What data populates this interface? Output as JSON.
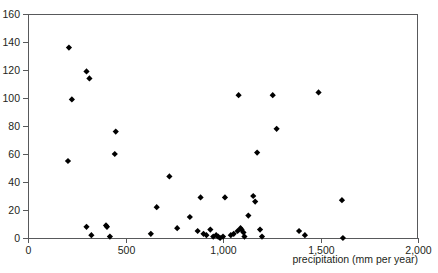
{
  "chart_data": {
    "type": "scatter",
    "title": "",
    "subtitle": "",
    "xlabel": "precipitation (mm per year)",
    "ylabel": "",
    "xlim": [
      0,
      2000
    ],
    "ylim": [
      0,
      160
    ],
    "xticks": [
      0,
      500,
      1000,
      1500,
      2000
    ],
    "xticklabels": [
      "0",
      "500",
      "1,000",
      "1,500",
      "2,000"
    ],
    "yticks": [
      0,
      20,
      40,
      60,
      80,
      100,
      120,
      140,
      160
    ],
    "yticklabels": [
      "0",
      "20",
      "40",
      "60",
      "80",
      "100",
      "120",
      "140",
      "160"
    ],
    "grid": false,
    "legend": null,
    "marker": {
      "shape": "diamond",
      "color": "#000000",
      "size": 5
    },
    "series": [
      {
        "name": "observations",
        "points": [
          [
            210,
            136
          ],
          [
            225,
            99
          ],
          [
            300,
            119
          ],
          [
            315,
            114
          ],
          [
            450,
            76
          ],
          [
            205,
            55
          ],
          [
            445,
            60
          ],
          [
            300,
            8
          ],
          [
            325,
            2
          ],
          [
            400,
            9
          ],
          [
            405,
            8
          ],
          [
            420,
            1
          ],
          [
            630,
            3
          ],
          [
            660,
            22
          ],
          [
            725,
            44
          ],
          [
            765,
            7
          ],
          [
            830,
            15
          ],
          [
            870,
            5
          ],
          [
            885,
            29
          ],
          [
            900,
            3
          ],
          [
            915,
            2
          ],
          [
            935,
            6
          ],
          [
            950,
            1
          ],
          [
            965,
            2
          ],
          [
            975,
            1
          ],
          [
            985,
            0
          ],
          [
            1000,
            1
          ],
          [
            1010,
            29
          ],
          [
            1040,
            2
          ],
          [
            1055,
            3
          ],
          [
            1075,
            5
          ],
          [
            1080,
            102
          ],
          [
            1090,
            7
          ],
          [
            1095,
            6
          ],
          [
            1105,
            4
          ],
          [
            1110,
            1
          ],
          [
            1130,
            16
          ],
          [
            1155,
            30
          ],
          [
            1165,
            26
          ],
          [
            1175,
            61
          ],
          [
            1190,
            6
          ],
          [
            1200,
            1
          ],
          [
            1255,
            102
          ],
          [
            1275,
            78
          ],
          [
            1390,
            5
          ],
          [
            1420,
            2
          ],
          [
            1490,
            104
          ],
          [
            1610,
            27
          ],
          [
            1615,
            0
          ]
        ]
      }
    ]
  },
  "axis": {
    "x_title": "precipitation (mm per year)"
  }
}
